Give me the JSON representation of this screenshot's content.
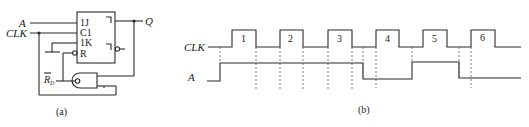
{
  "figure_a": {
    "caption": "(a)",
    "inputs": {
      "a": "A",
      "clk": "CLK",
      "reset": "R",
      "reset_sub": "D"
    },
    "output": "Q",
    "flipflop_pins": [
      "1J",
      "C1",
      "1K",
      "R"
    ],
    "gate": "NAND"
  },
  "figure_b": {
    "caption": "(b)",
    "signals": [
      {
        "name": "CLK",
        "type": "clock"
      },
      {
        "name": "A",
        "type": "input"
      }
    ],
    "pulse_labels": [
      "1",
      "2",
      "3",
      "4",
      "5",
      "6"
    ],
    "clk_edges": [
      {
        "rise": 232,
        "fall": 256
      },
      {
        "rise": 280,
        "fall": 303
      },
      {
        "rise": 328,
        "fall": 352
      },
      {
        "rise": 376,
        "fall": 399
      },
      {
        "rise": 423,
        "fall": 447
      },
      {
        "rise": 471,
        "fall": 495
      }
    ],
    "a_transitions": [
      {
        "x": 220,
        "level": "high"
      },
      {
        "x": 363,
        "level": "low"
      },
      {
        "x": 412,
        "level": "high"
      },
      {
        "x": 459,
        "level": "low"
      }
    ]
  }
}
